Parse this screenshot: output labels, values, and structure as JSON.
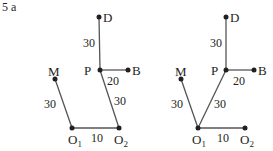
{
  "heading": "5  a",
  "colors": {
    "ink": "#231f20",
    "line": "#555555"
  },
  "diagrams": [
    {
      "name": "left",
      "points": {
        "D": {
          "label": "D",
          "x": 99,
          "y": 17
        },
        "P": {
          "label": "P",
          "x": 100,
          "y": 70
        },
        "B": {
          "label": "B",
          "x": 128,
          "y": 70
        },
        "M": {
          "label": "M",
          "x": 55,
          "y": 79
        },
        "O1": {
          "label": "O",
          "sub": "1",
          "x": 72,
          "y": 128
        },
        "O2": {
          "label": "O",
          "sub": "2",
          "x": 119,
          "y": 128
        }
      },
      "edges": [
        {
          "from": "D",
          "to": "P",
          "length": "30"
        },
        {
          "from": "P",
          "to": "B",
          "length": "20"
        },
        {
          "from": "M",
          "to": "O1",
          "length": "30"
        },
        {
          "from": "P",
          "to": "O2",
          "length": "30"
        },
        {
          "from": "O1",
          "to": "O2",
          "length": "10"
        }
      ]
    },
    {
      "name": "right",
      "points": {
        "D": {
          "label": "D",
          "x": 226,
          "y": 17
        },
        "P": {
          "label": "P",
          "x": 226,
          "y": 70
        },
        "B": {
          "label": "B",
          "x": 254,
          "y": 70
        },
        "M": {
          "label": "M",
          "x": 181,
          "y": 79
        },
        "O1": {
          "label": "O",
          "sub": "1",
          "x": 198,
          "y": 128
        },
        "O2": {
          "label": "O",
          "sub": "2",
          "x": 245,
          "y": 128
        }
      },
      "edges": [
        {
          "from": "D",
          "to": "P",
          "length": "30"
        },
        {
          "from": "P",
          "to": "B",
          "length": "20"
        },
        {
          "from": "M",
          "to": "O1",
          "length": "30"
        },
        {
          "from": "P",
          "to": "O1",
          "length": "30"
        },
        {
          "from": "O1",
          "to": "O2",
          "length": "10"
        }
      ]
    }
  ]
}
